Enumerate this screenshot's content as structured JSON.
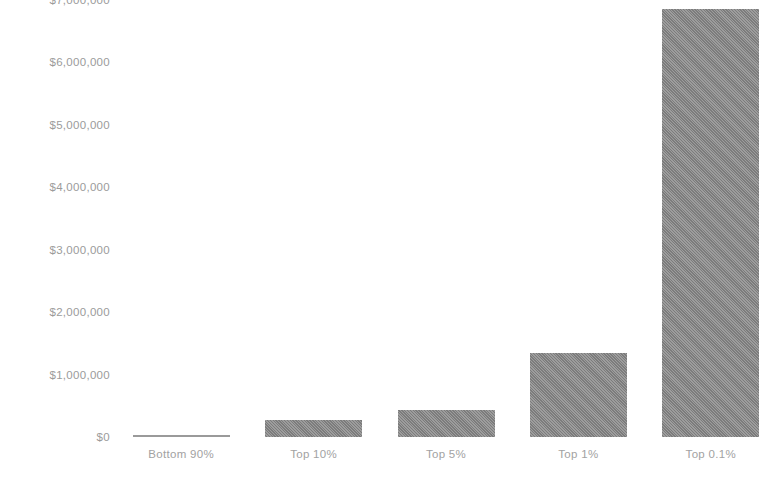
{
  "chart_data": {
    "type": "bar",
    "title": "",
    "subtitle": "",
    "xlabel": "",
    "ylabel": "",
    "categories": [
      "Bottom 90%",
      "Top 10%",
      "Top 5%",
      "Top 1%",
      "Top 0.1%"
    ],
    "values": [
      36000,
      280000,
      430000,
      1350000,
      6850000
    ],
    "ylim": [
      0,
      7000000
    ],
    "ytick_values": [
      0,
      1000000,
      2000000,
      3000000,
      4000000,
      5000000,
      6000000,
      7000000
    ],
    "ytick_labels": [
      "$0",
      "$1,000,000",
      "$2,000,000",
      "$3,000,000",
      "$4,000,000",
      "$5,000,000",
      "$6,000,000",
      "$7,000,000"
    ],
    "grid": false,
    "legend": false,
    "legend_position": "none",
    "bar_color": "#8a8a8a",
    "background_color": "#ffffff",
    "axis_label_color": "#9b9b9b"
  }
}
